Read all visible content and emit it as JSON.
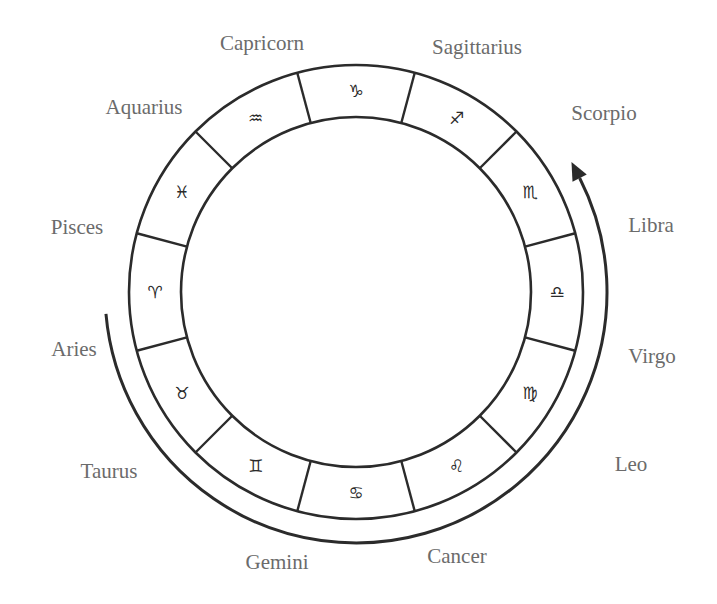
{
  "diagram": {
    "center": {
      "x": 356,
      "y": 292
    },
    "outer_radius": 227,
    "inner_radius": 175,
    "arrow_radius": 251,
    "stroke_color": "#2b2b2b",
    "label_color": "#6b6b6b",
    "arrow": {
      "direction": "counterclockwise",
      "start_angle_deg": 185,
      "end_angle_deg": 27
    },
    "signs": [
      {
        "name": "Aries",
        "glyph": "♈",
        "angle": 180,
        "label_pos": {
          "x": 74,
          "y": 349
        }
      },
      {
        "name": "Taurus",
        "glyph": "♉",
        "angle": 210,
        "label_pos": {
          "x": 109,
          "y": 471
        }
      },
      {
        "name": "Gemini",
        "glyph": "♊",
        "angle": 240,
        "label_pos": {
          "x": 277,
          "y": 562
        }
      },
      {
        "name": "Cancer",
        "glyph": "♋",
        "angle": 270,
        "label_pos": {
          "x": 457,
          "y": 556
        }
      },
      {
        "name": "Leo",
        "glyph": "♌",
        "angle": 300,
        "label_pos": {
          "x": 631,
          "y": 464
        }
      },
      {
        "name": "Virgo",
        "glyph": "♍",
        "angle": 330,
        "label_pos": {
          "x": 652,
          "y": 356
        }
      },
      {
        "name": "Libra",
        "glyph": "♎",
        "angle": 0,
        "label_pos": {
          "x": 651,
          "y": 225
        }
      },
      {
        "name": "Scorpio",
        "glyph": "♏",
        "angle": 30,
        "label_pos": {
          "x": 604,
          "y": 113
        }
      },
      {
        "name": "Sagittarius",
        "glyph": "♐",
        "angle": 60,
        "label_pos": {
          "x": 477,
          "y": 47
        }
      },
      {
        "name": "Capricorn",
        "glyph": "♑",
        "angle": 90,
        "label_pos": {
          "x": 262,
          "y": 43
        }
      },
      {
        "name": "Aquarius",
        "glyph": "♒",
        "angle": 120,
        "label_pos": {
          "x": 144,
          "y": 107
        }
      },
      {
        "name": "Pisces",
        "glyph": "♓",
        "angle": 150,
        "label_pos": {
          "x": 77,
          "y": 227
        }
      }
    ]
  }
}
